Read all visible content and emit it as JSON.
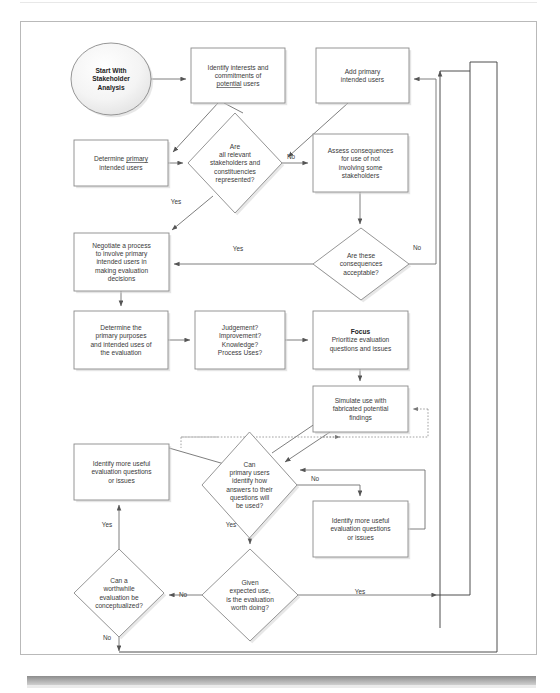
{
  "figure": {
    "type": "flowchart",
    "frame": {
      "x": 20,
      "y": 21,
      "w": 517,
      "h": 634
    }
  },
  "nodes": [
    {
      "id": "start",
      "shape": "ellipse",
      "bold": true,
      "x": 71,
      "y": 43,
      "w": 80,
      "h": 72,
      "lines": [
        "Start With",
        "Stakeholder",
        "Analysis"
      ]
    },
    {
      "id": "identify_interests",
      "shape": "rect",
      "x": 191,
      "y": 48,
      "w": 94,
      "h": 55,
      "lines": [
        "Identify interests and",
        "commitments of",
        "potential users"
      ],
      "underline_line": 2,
      "underline_word": "potential"
    },
    {
      "id": "add_primary",
      "shape": "rect",
      "x": 316,
      "y": 48,
      "w": 93,
      "h": 55,
      "lines": [
        "Add primary",
        "intended users"
      ]
    },
    {
      "id": "determine_primary",
      "shape": "rect",
      "x": 74,
      "y": 140,
      "w": 94,
      "h": 46,
      "lines": [
        "Determine primary",
        "intended users"
      ],
      "underline_line": 0,
      "underline_word": "primary"
    },
    {
      "id": "dec_all_relevant",
      "shape": "diamond",
      "x": 188,
      "y": 113,
      "w": 94,
      "h": 100,
      "lines": [
        "Are",
        "all relevant",
        "stakeholders and",
        "constituencies",
        "represented?"
      ]
    },
    {
      "id": "assess_consequences",
      "shape": "rect",
      "x": 313,
      "y": 134,
      "w": 95,
      "h": 58,
      "lines": [
        "Assess consequences",
        "for use of not",
        "involving some",
        "stakeholders"
      ]
    },
    {
      "id": "negotiate",
      "shape": "rect",
      "x": 74,
      "y": 233,
      "w": 95,
      "h": 58,
      "lines": [
        "Negotiate a process",
        "to involve primary",
        "intended users in",
        "making evaluation",
        "decisions"
      ]
    },
    {
      "id": "dec_consequences_ok",
      "shape": "diamond",
      "x": 313,
      "y": 228,
      "w": 96,
      "h": 72,
      "lines": [
        "Are these",
        "consequences",
        "acceptable?"
      ]
    },
    {
      "id": "determine_purposes",
      "shape": "rect",
      "x": 74,
      "y": 311,
      "w": 94,
      "h": 58,
      "lines": [
        "Determine the",
        "primary purposes",
        "and intended uses of",
        "the evaluation"
      ]
    },
    {
      "id": "judgement_list",
      "shape": "rect",
      "x": 195,
      "y": 311,
      "w": 90,
      "h": 58,
      "lines": [
        "Judgement?",
        "Improvement?",
        "Knowledge?",
        "Process Uses?"
      ]
    },
    {
      "id": "focus",
      "shape": "rect",
      "bold_first": true,
      "x": 313,
      "y": 311,
      "w": 95,
      "h": 58,
      "lines": [
        "Focus",
        "Prioritize evaluation",
        "questions and issues"
      ]
    },
    {
      "id": "simulate",
      "shape": "rect",
      "x": 313,
      "y": 386,
      "w": 95,
      "h": 46,
      "lines": [
        "Simulate use with",
        "fabricated potential",
        "findings"
      ]
    },
    {
      "id": "identify_more_left",
      "shape": "rect",
      "x": 74,
      "y": 444,
      "w": 95,
      "h": 56,
      "lines": [
        "Identify more useful",
        "evaluation questions",
        "or issues"
      ]
    },
    {
      "id": "dec_can_primary",
      "shape": "diamond",
      "x": 202,
      "y": 432,
      "w": 95,
      "h": 106,
      "lines": [
        "Can",
        "primary users",
        "identify how",
        "answers to their",
        "questions will",
        "be used?"
      ]
    },
    {
      "id": "identify_more_right",
      "shape": "rect",
      "x": 313,
      "y": 501,
      "w": 95,
      "h": 56,
      "lines": [
        "Identify more useful",
        "evaluation questions",
        "or issues"
      ]
    },
    {
      "id": "dec_worthwhile",
      "shape": "diamond",
      "x": 74,
      "y": 549,
      "w": 90,
      "h": 88,
      "lines": [
        "Can a",
        "worthwhile",
        "evaluation be",
        "conceptualized?"
      ]
    },
    {
      "id": "dec_given_use",
      "shape": "diamond",
      "x": 202,
      "y": 549,
      "w": 96,
      "h": 92,
      "lines": [
        "Given",
        "expected use,",
        "is the evaluation",
        "worth doing?"
      ]
    }
  ],
  "edge_labels": [
    {
      "id": "no-all-relevant",
      "text": "No",
      "x": 291,
      "y": 159
    },
    {
      "id": "yes-all-relevant",
      "text": "Yes",
      "x": 176,
      "y": 204
    },
    {
      "id": "yes-consequences",
      "text": "Yes",
      "x": 238,
      "y": 251
    },
    {
      "id": "no-consequences",
      "text": "No",
      "x": 417,
      "y": 250
    },
    {
      "id": "no-can-primary",
      "text": "No",
      "x": 315,
      "y": 481
    },
    {
      "id": "yes-can-primary-down",
      "text": "Yes",
      "x": 231,
      "y": 527
    },
    {
      "id": "yes-worthwhile-up",
      "text": "Yes",
      "x": 107,
      "y": 527
    },
    {
      "id": "no-given-use",
      "text": "No",
      "x": 183,
      "y": 597
    },
    {
      "id": "yes-given-use",
      "text": "Yes",
      "x": 360,
      "y": 594
    },
    {
      "id": "no-worthwhile-down",
      "text": "No",
      "x": 107,
      "y": 640
    }
  ],
  "colors": {
    "stroke": "#6f6f6f",
    "node_stroke": "#8a8a8a",
    "text": "#3a3a3a",
    "frame": "#b9b9b9",
    "shadow": "#cfcfcf",
    "bottom_bar": "#9a9a9a"
  }
}
